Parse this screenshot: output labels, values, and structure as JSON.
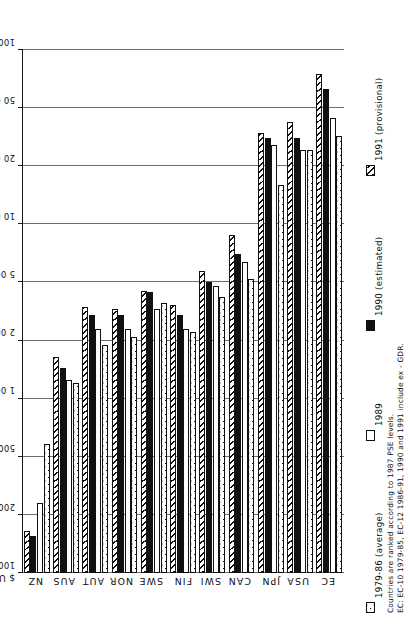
{
  "chart": {
    "axis_title": "$ US mn (log scale)",
    "tick_labels": [
      "100 000",
      "50 000",
      "20 000",
      "10 000",
      "5 000",
      "2 000",
      "1 000",
      "500",
      "200",
      "100"
    ],
    "country_labels": [
      "EC",
      "USA",
      "JPN",
      "CAN",
      "SWI",
      "FIN",
      "SWE",
      "NOR",
      "AUT",
      "AUS",
      "NZ"
    ],
    "legend": [
      {
        "label": "1979-86 (average)",
        "pattern": "dotted"
      },
      {
        "label": "1989",
        "pattern": "open"
      },
      {
        "label": "1990 (estimated)",
        "pattern": "solid"
      },
      {
        "label": "1991 (provisional)",
        "pattern": "hatched"
      }
    ],
    "notes": [
      "Countries are ranked according to 1987 PSE levels.",
      "EC: EC-10 1979-85, EC-12 1986-91, 1990 and 1991 include ex - GDR."
    ]
  },
  "chart_data": {
    "type": "bar",
    "orientation": "horizontal",
    "title": "",
    "xlabel": "$ US mn (log scale)",
    "ylabel": "",
    "scale": "log",
    "xlim": [
      100,
      100000
    ],
    "grid": true,
    "legend_position": "bottom",
    "categories": [
      "EC",
      "USA",
      "JPN",
      "CAN",
      "SWI",
      "FIN",
      "SWE",
      "NOR",
      "AUT",
      "AUS",
      "NZ"
    ],
    "series": [
      {
        "name": "1979-86 (average)",
        "pattern": "dotted",
        "values": [
          32000,
          26000,
          16000,
          5200,
          4000,
          2300,
          3600,
          2100,
          1900,
          1200,
          580
        ]
      },
      {
        "name": "1989",
        "pattern": "open",
        "values": [
          43000,
          26000,
          28000,
          6400,
          4700,
          2400,
          3300,
          2400,
          2400,
          1250,
          240
        ]
      },
      {
        "name": "1990 (estimated)",
        "pattern": "solid",
        "values": [
          63000,
          31000,
          31000,
          7000,
          5000,
          3000,
          4300,
          3000,
          3000,
          1450,
          155
        ]
      },
      {
        "name": "1991 (provisional)",
        "pattern": "hatched",
        "values": [
          75000,
          40000,
          34000,
          8800,
          5700,
          3500,
          4400,
          3300,
          3400,
          1650,
          165
        ]
      }
    ],
    "annotations": [
      "Countries are ranked according to 1987 PSE levels.",
      "EC: EC-10 1979-85, EC-12 1986-91, 1990 and 1991 include ex - GDR."
    ]
  }
}
